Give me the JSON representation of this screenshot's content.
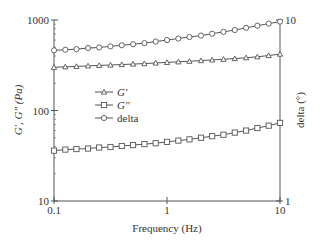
{
  "chart_data": {
    "type": "line",
    "title": "",
    "xlabel": "Frequency (Hz)",
    "ylabel": "G′, G″ (Pa)",
    "ylabel_right": "delta (°)",
    "xscale": "log",
    "yscale": "log",
    "xlim": [
      0.1,
      10
    ],
    "ylim": [
      10,
      1000
    ],
    "ylim_right": [
      1,
      10
    ],
    "x_ticks": [
      "0.1",
      "1",
      "10"
    ],
    "y_ticks": [
      "10",
      "100",
      "1000"
    ],
    "y_right_ticks": [
      "1",
      "10"
    ],
    "grid": false,
    "legend_position": "center-left inside plot",
    "x": [
      0.1,
      0.126,
      0.158,
      0.2,
      0.251,
      0.316,
      0.398,
      0.501,
      0.631,
      0.794,
      1.0,
      1.26,
      1.58,
      2.0,
      2.51,
      3.16,
      3.98,
      5.01,
      6.31,
      7.94,
      10.0
    ],
    "series": [
      {
        "name": "G′",
        "axis": "left",
        "marker": "triangle",
        "values": [
          300,
          304,
          307,
          311,
          315,
          318,
          322,
          326,
          330,
          335,
          340,
          345,
          350,
          356,
          362,
          368,
          375,
          383,
          392,
          405,
          420
        ]
      },
      {
        "name": "G″",
        "axis": "left",
        "marker": "square",
        "values": [
          36,
          37,
          37.5,
          38,
          39,
          39.5,
          40.5,
          41.5,
          42.5,
          43.5,
          45,
          46.5,
          48,
          50,
          52,
          54,
          57,
          60,
          64,
          68,
          73
        ]
      },
      {
        "name": "delta",
        "axis": "right",
        "marker": "circle",
        "values": [
          6.8,
          6.85,
          6.9,
          7.0,
          7.05,
          7.15,
          7.25,
          7.35,
          7.45,
          7.6,
          7.75,
          7.9,
          8.05,
          8.2,
          8.4,
          8.6,
          8.8,
          9.05,
          9.3,
          9.55,
          9.8
        ]
      }
    ]
  },
  "colors": {
    "axis": "#555555",
    "series_line": "#555555",
    "text": "#333333"
  }
}
